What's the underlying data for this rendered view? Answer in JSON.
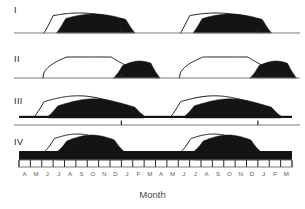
{
  "figure": {
    "axis_title": "Month",
    "n_months": 24,
    "plot_left": 19,
    "plot_right": 292,
    "rows": [
      {
        "label": "I",
        "label_x": 14,
        "label_y": 6,
        "baseline_y": 33,
        "band_height": 0,
        "axis_style": "single-line-major-ticks",
        "major_ticks": [
          9,
          21
        ],
        "curves": [
          {
            "type": "outline",
            "peak_month": 5.3,
            "amplitude": 20,
            "width": 4.3,
            "start_month": 2.2,
            "end_month": 9.4
          },
          {
            "type": "filled",
            "peak_month": 6.6,
            "amplitude": 19,
            "width": 3.4,
            "start_month": 3.3,
            "end_month": 10.2
          },
          {
            "type": "outline",
            "peak_month": 17.3,
            "amplitude": 20,
            "width": 4.3,
            "start_month": 14.2,
            "end_month": 21.4
          },
          {
            "type": "filled",
            "peak_month": 18.6,
            "amplitude": 19,
            "width": 3.4,
            "start_month": 15.3,
            "end_month": 22.2
          }
        ]
      },
      {
        "label": "II",
        "label_x": 14,
        "label_y": 55,
        "baseline_y": 78,
        "band_height": 0,
        "axis_style": "single-line-major-ticks",
        "major_ticks": [
          9,
          21
        ],
        "curves": [
          {
            "type": "plateau",
            "rise_month": 2.1,
            "plateau_start": 4.2,
            "plateau_end": 8.1,
            "fall_month": 12.2,
            "amplitude": 21
          },
          {
            "type": "filled",
            "peak_month": 10.6,
            "amplitude": 17,
            "width": 1.9,
            "start_month": 8.3,
            "end_month": 12.4
          },
          {
            "type": "plateau",
            "rise_month": 14.1,
            "plateau_start": 16.2,
            "plateau_end": 20.1,
            "fall_month": 24.2,
            "amplitude": 21
          },
          {
            "type": "filled",
            "peak_month": 22.6,
            "amplitude": 17,
            "width": 1.9,
            "start_month": 20.3,
            "end_month": 24.4
          }
        ]
      },
      {
        "label": "III",
        "label_x": 14,
        "label_y": 97,
        "baseline_y": 118,
        "band_height": 2.2,
        "axis_style": "offset-line-major-ticks",
        "axis_offset_y": 7,
        "major_ticks": [
          9,
          21
        ],
        "curves": [
          {
            "type": "outline",
            "peak_month": 5.2,
            "amplitude": 20,
            "width": 3.6,
            "start_month": 1.4,
            "end_month": 9.2
          },
          {
            "type": "filled",
            "peak_month": 6.6,
            "amplitude": 17,
            "width": 3.1,
            "start_month": 2.6,
            "end_month": 11.0
          },
          {
            "type": "outline",
            "peak_month": 17.2,
            "amplitude": 20,
            "width": 3.6,
            "start_month": 13.4,
            "end_month": 21.2
          },
          {
            "type": "filled",
            "peak_month": 18.6,
            "amplitude": 17,
            "width": 3.1,
            "start_month": 14.6,
            "end_month": 23.0
          }
        ]
      },
      {
        "label": "IV",
        "label_x": 14,
        "label_y": 138,
        "baseline_y": 160,
        "band_height": 9,
        "axis_style": "boxed-all-ticks",
        "major_ticks": [],
        "curves": [
          {
            "type": "outline",
            "peak_month": 5.1,
            "amplitude": 17,
            "width": 2.5,
            "start_month": 2.3,
            "end_month": 8.0
          },
          {
            "type": "filled",
            "peak_month": 6.4,
            "amplitude": 16,
            "width": 2.3,
            "start_month": 3.4,
            "end_month": 9.2
          },
          {
            "type": "outline",
            "peak_month": 17.1,
            "amplitude": 17,
            "width": 2.5,
            "start_month": 14.3,
            "end_month": 20.0
          },
          {
            "type": "filled",
            "peak_month": 18.4,
            "amplitude": 16,
            "width": 2.3,
            "start_month": 15.4,
            "end_month": 21.2
          }
        ]
      }
    ],
    "month_labels": [
      "A",
      "M",
      "J",
      "J",
      "A",
      "S",
      "O",
      "N",
      "D",
      "J",
      "F",
      "M",
      "A",
      "M",
      "J",
      "J",
      "A",
      "S",
      "O",
      "N",
      "D",
      "J",
      "F",
      "M"
    ],
    "month_axis_y": 160,
    "month_label_y": 171,
    "axis_title_y": 189,
    "colors": {
      "fill": "#141414",
      "outline": "#141414",
      "axis": "#7a7a7a",
      "label": "#1a1a1a",
      "month_label": "#5e5e5e",
      "background": "#ffffff"
    }
  },
  "chart_data": {
    "type": "area",
    "title": "",
    "subtitle": "",
    "xlabel": "Month",
    "ylabel": "",
    "grid": false,
    "legend": "none",
    "x": [
      "A",
      "M",
      "J",
      "J",
      "A",
      "S",
      "O",
      "N",
      "D",
      "J",
      "F",
      "M",
      "A",
      "M",
      "J",
      "J",
      "A",
      "S",
      "O",
      "N",
      "D",
      "J",
      "F",
      "M"
    ],
    "xlim": [
      0,
      24
    ],
    "ylim": [
      0,
      24
    ],
    "panels": [
      {
        "name": "I",
        "description": "Narrow unimodal annual peak; open (outline) curve peaks around August, shaded (filled) curve peaks about one month later around September, returning to zero between cycles.",
        "series": [
          {
            "name": "outline",
            "peak_month_label": "A",
            "peak_index": 5.3,
            "peak_value": 20,
            "values": [
              0,
              0,
              2,
              7,
              15,
              20,
              19,
              13,
              6,
              2,
              0,
              0,
              0,
              0,
              2,
              7,
              15,
              20,
              19,
              13,
              6,
              2,
              0,
              0
            ]
          },
          {
            "name": "filled",
            "peak_month_label": "S",
            "peak_index": 6.6,
            "peak_value": 19,
            "values": [
              0,
              0,
              0,
              2,
              8,
              16,
              19,
              16,
              9,
              3,
              0,
              0,
              0,
              0,
              0,
              2,
              8,
              16,
              19,
              16,
              9,
              3,
              0,
              0
            ]
          }
        ]
      },
      {
        "name": "II",
        "description": "Broad plateau from early summer through winter in the open curve; shaded curve forms a single late peak near December at the end of the plateau.",
        "series": [
          {
            "name": "outline",
            "peak_month_label": "plateau J-D",
            "peak_index": 6.0,
            "peak_value": 21,
            "values": [
              0,
              1,
              10,
              19,
              21,
              21,
              21,
              20,
              18,
              13,
              5,
              0,
              0,
              1,
              10,
              19,
              21,
              21,
              21,
              20,
              18,
              13,
              5,
              0
            ]
          },
          {
            "name": "filled",
            "peak_month_label": "D",
            "peak_index": 10.6,
            "peak_value": 17,
            "values": [
              0,
              0,
              0,
              0,
              0,
              0,
              0,
              0,
              4,
              12,
              17,
              6,
              0,
              0,
              0,
              0,
              0,
              0,
              0,
              0,
              4,
              12,
              17,
              6
            ]
          }
        ]
      },
      {
        "name": "III",
        "description": "Continuous low background level all year with an annual peak; open curve peaks near August, shaded curve peaks near September and remains above zero between cycles.",
        "series": [
          {
            "name": "outline",
            "peak_month_label": "A",
            "peak_index": 5.2,
            "peak_value": 20,
            "values": [
              2,
              4,
              9,
              16,
              20,
              19,
              15,
              9,
              5,
              3,
              2,
              2,
              2,
              4,
              9,
              16,
              20,
              19,
              15,
              9,
              5,
              3,
              2,
              2
            ]
          },
          {
            "name": "filled",
            "peak_month_label": "S",
            "peak_index": 6.6,
            "peak_value": 17,
            "values": [
              2,
              2,
              4,
              8,
              14,
              17,
              16,
              12,
              7,
              4,
              2,
              2,
              2,
              2,
              4,
              8,
              14,
              17,
              16,
              12,
              7,
              4,
              2,
              2
            ]
          }
        ]
      },
      {
        "name": "IV",
        "description": "High continuous background present all year with a modest annual rise; open curve peaks near August, shaded curve peaks near September, never dropping to zero.",
        "series": [
          {
            "name": "outline",
            "peak_month_label": "A",
            "peak_index": 5.1,
            "peak_value": 17,
            "values": [
              9,
              9,
              11,
              15,
              17,
              16,
              13,
              10,
              9,
              9,
              9,
              9,
              9,
              9,
              11,
              15,
              17,
              16,
              13,
              10,
              9,
              9,
              9,
              9
            ]
          },
          {
            "name": "filled",
            "peak_month_label": "S",
            "peak_index": 6.4,
            "peak_value": 16,
            "values": [
              9,
              9,
              9,
              12,
              15,
              16,
              15,
              12,
              10,
              9,
              9,
              9,
              9,
              9,
              9,
              12,
              15,
              16,
              15,
              12,
              10,
              9,
              9,
              9
            ]
          }
        ]
      }
    ]
  }
}
